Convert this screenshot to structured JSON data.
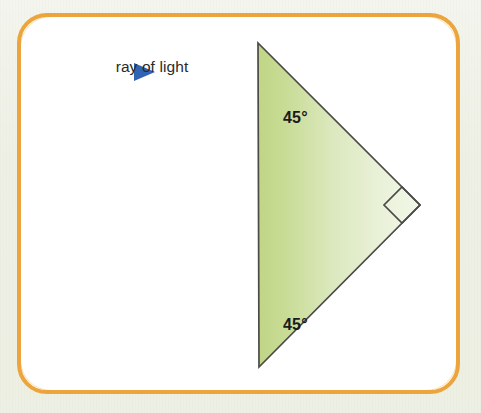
{
  "figure": {
    "type": "geometry-diagram",
    "background_color": "#eef0e5",
    "panel": {
      "border_color": "#eca53c",
      "fill_color": "#ffffff",
      "border_width_px": 4,
      "corner_radius_px": 30
    }
  },
  "labels": {
    "ray_label": "ray of light",
    "angle_top": "45°",
    "angle_bottom": "45°"
  },
  "ray": {
    "color": "#3068b8",
    "start_x": 62,
    "end_x": 232,
    "y": 72,
    "arrowhead_tip_x": 153,
    "arrowhead_name": "right-arrowhead"
  },
  "triangle": {
    "name": "right-isosceles-prism",
    "points": "256,43 257,367 418,205",
    "fill_left_color": "#c4d88d",
    "fill_right_color": "#eef3e0",
    "stroke_color": "#4a4a46",
    "stroke_width": 1.6,
    "vertices": [
      {
        "name": "top-vertex",
        "x": 256,
        "y": 43,
        "angle": "45°"
      },
      {
        "name": "bottom-vertex",
        "x": 257,
        "y": 367,
        "angle": "45°"
      },
      {
        "name": "right-vertex",
        "x": 418,
        "y": 205,
        "angle": "90°"
      }
    ]
  },
  "right_angle_marker": {
    "name": "right-angle-square",
    "points": "418,205 400,187 382,205 400,223",
    "stroke_color": "#4a4a46",
    "fill_color": "#ffffff"
  }
}
